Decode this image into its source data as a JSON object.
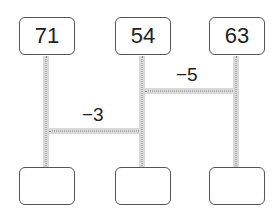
{
  "diagram": {
    "type": "amidakuji-ladder",
    "top_boxes": [
      {
        "value": "71"
      },
      {
        "value": "54"
      },
      {
        "value": "63"
      }
    ],
    "bottom_boxes": [
      {
        "value": ""
      },
      {
        "value": ""
      },
      {
        "value": ""
      }
    ],
    "rungs": [
      {
        "between": [
          "54",
          "63"
        ],
        "label": "−5"
      },
      {
        "between": [
          "71",
          "54"
        ],
        "label": "−3"
      }
    ]
  },
  "colors": {
    "line": "#d9d9d9",
    "dots": "#8a8a8a",
    "box_border": "#555555"
  }
}
